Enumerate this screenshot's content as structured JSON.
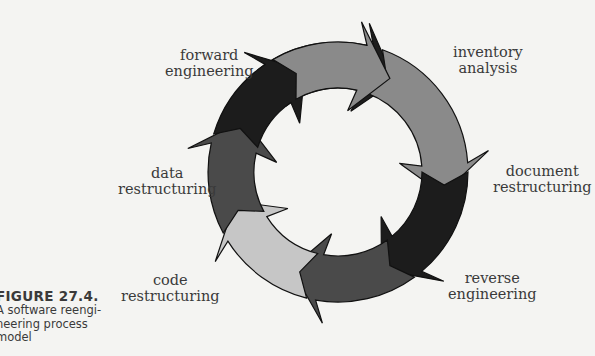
{
  "figure": {
    "number": "FIGURE 27.4.",
    "caption": "A software reengineering process model",
    "caption_lines": [
      "A software reengi-",
      "neering process",
      "model"
    ]
  },
  "labels": {
    "forward_engineering": [
      "forward",
      "engineering"
    ],
    "inventory_analysis": [
      "inventory",
      "analysis"
    ],
    "document_restructuring": [
      "document",
      "restructuring"
    ],
    "reverse_engineering": [
      "reverse",
      "engineering"
    ],
    "code_restructuring": [
      "code",
      "restructuring"
    ],
    "data_restructuring": [
      "data",
      "restructuring"
    ]
  },
  "segments": [
    {
      "name": "top-arrow",
      "label": "",
      "color": "#1e1e1e"
    },
    {
      "name": "inventory-analysis-arrow",
      "label": "inventory analysis",
      "color": "#8a8a8a"
    },
    {
      "name": "document-restructuring-arrow",
      "label": "document restructuring",
      "color": "#1c1c1c"
    },
    {
      "name": "reverse-engineering-arrow",
      "label": "reverse engineering",
      "color": "#4a4a4a"
    },
    {
      "name": "code-restructuring-arrow",
      "label": "code restructuring",
      "color": "#c6c6c6"
    },
    {
      "name": "lower-left-arrow",
      "label": "",
      "color": "#4a4a4a"
    },
    {
      "name": "data-restructuring-arrow",
      "label": "data restructuring",
      "color": "#1c1c1c"
    },
    {
      "name": "forward-engineering-arrow",
      "label": "forward engineering",
      "color": "#8a8a8a"
    }
  ],
  "colors": {
    "outline": "#111111",
    "background": "#f4f4f2"
  }
}
